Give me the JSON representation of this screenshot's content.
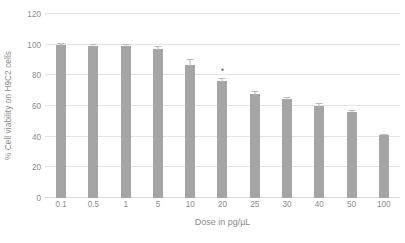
{
  "chart_data": {
    "type": "bar",
    "title": "",
    "xlabel": "Dose in pg/µL",
    "ylabel": "% Cell viability on H9C2 cells",
    "categories": [
      "0.1",
      "0.5",
      "1",
      "5",
      "10",
      "20",
      "25",
      "30",
      "40",
      "50",
      "100"
    ],
    "values": [
      100,
      99,
      99,
      97,
      87,
      76,
      68,
      64.5,
      60,
      56,
      41
    ],
    "errors": [
      1.0,
      1.5,
      1.5,
      2.0,
      3.5,
      2.5,
      2.0,
      1.5,
      2.0,
      1.5,
      1.0
    ],
    "annotations": [
      {
        "category": "20",
        "text": "*"
      }
    ],
    "ylim": [
      0,
      120
    ],
    "yticks": [
      0,
      20,
      40,
      60,
      80,
      100,
      120
    ],
    "ytick_labels": [
      "0",
      "20",
      "40",
      "60",
      "80",
      "100",
      "120"
    ],
    "grid": true,
    "legend": false,
    "bar_color": "#a5a5a5",
    "gridline_color": "#e4e4e4",
    "text_color": "#8c8c8c"
  }
}
